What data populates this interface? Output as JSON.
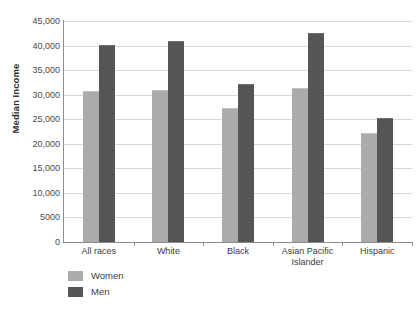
{
  "chart_data": {
    "type": "bar",
    "title": "",
    "xlabel": "",
    "ylabel": "Median Income",
    "ylim": [
      0,
      45000
    ],
    "ytick_labels": [
      "45,000",
      "40,000",
      "35,000",
      "30,000",
      "25,000",
      "20,000",
      "15,000",
      "10,000",
      "5000",
      "0"
    ],
    "ytick_values": [
      45000,
      40000,
      35000,
      30000,
      25000,
      20000,
      15000,
      10000,
      5000,
      0
    ],
    "grid": true,
    "legend_position": "bottom-left",
    "categories": [
      "All races",
      "White",
      "Black",
      "Asian Pacific Islander",
      "Hispanic"
    ],
    "series": [
      {
        "name": "Women",
        "color": "#ababab",
        "values": [
          30500,
          30800,
          27000,
          31200,
          22000
        ]
      },
      {
        "name": "Men",
        "color": "#555555",
        "values": [
          40000,
          40800,
          32000,
          42300,
          25000
        ]
      }
    ]
  },
  "legend": {
    "items": [
      {
        "label": "Women"
      },
      {
        "label": "Men"
      }
    ]
  }
}
